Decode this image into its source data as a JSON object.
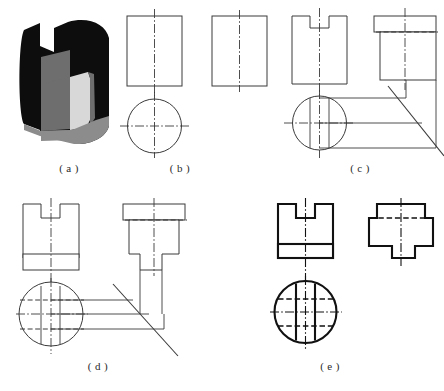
{
  "figure": {
    "background_color": "#ffffff",
    "line_color": "#3a3a3a",
    "bold_line_color": "#111111",
    "panel_count": 5
  },
  "panels": [
    {
      "id": "a",
      "caption": "( a )",
      "kind": "pictorial",
      "description": "Shaded 3D pictorial of a cylinder with a rectangular notch cut from the top and a flat step",
      "colors": {
        "dark": "#0d0d0d",
        "mid": "#6e6e6e",
        "light": "#d8d8d8",
        "base": "#8c8c8c"
      }
    },
    {
      "id": "b",
      "caption": "( b )",
      "kind": "orthographic-step",
      "description": "Step 1: blank front view rectangle, side view rectangle and top view circle with centre lines",
      "views": [
        "front-rectangle",
        "side-rectangle",
        "top-circle"
      ]
    },
    {
      "id": "c",
      "caption": "( c )",
      "kind": "orthographic-step",
      "description": "Step 2: notch added to front view, projected to side view with hidden line, 45 degree miter line and projection lines added",
      "views": [
        "front-notched",
        "side-stepped-top",
        "top-circle",
        "miter-line"
      ]
    },
    {
      "id": "d",
      "caption": "( d )",
      "kind": "orthographic-step",
      "description": "Step 3: horizontal cut band added to front view, chordal cut shown as hidden lines in top view, side view completed with lower step",
      "views": [
        "front-notched-band",
        "side-stepped-full",
        "top-circle-cuts",
        "miter-line"
      ]
    },
    {
      "id": "e",
      "caption": "( e )",
      "kind": "orthographic-result",
      "description": "Step 4: finished three-view drawing with heavy visible outlines, hidden lines and centre lines",
      "views": [
        "front-final",
        "side-final",
        "top-final"
      ]
    }
  ],
  "line_legend": {
    "visible": "continuous thick outline",
    "hidden": "dashed line",
    "center": "long-dash dot-dash chain line",
    "projection": "thin continuous construction line",
    "miter": "45 degree reference line"
  }
}
